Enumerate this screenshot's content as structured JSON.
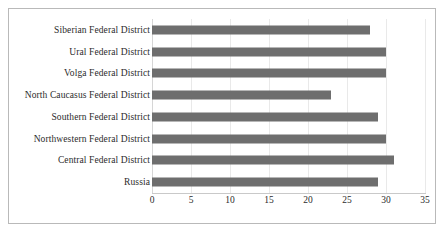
{
  "chart_data": {
    "type": "bar",
    "orientation": "horizontal",
    "title": "",
    "subtitle": "",
    "xlabel": "",
    "ylabel": "",
    "xlim": [
      0,
      35
    ],
    "xticks": [
      0,
      5,
      10,
      15,
      20,
      25,
      30,
      35
    ],
    "xtick_labels": [
      "0",
      "5",
      "10",
      "15",
      "20",
      "25",
      "30",
      "35"
    ],
    "grid": true,
    "legend": false,
    "legend_position": "none",
    "bar_color": "#6e6e6e",
    "gridline_color": "#e9e9e9",
    "frame_color": "#b9b9b9",
    "categories": [
      "Siberian Federal District",
      "Ural Federal District",
      "Volga Federal District",
      "North Caucasus Federal District",
      "Southern Federal District",
      "Northwestern Federal District",
      "Central Federal District",
      "Russia"
    ],
    "values": [
      28,
      30,
      30,
      23,
      29,
      30,
      31,
      29
    ],
    "bars": [
      {
        "label": "Siberian Federal District",
        "value": 28
      },
      {
        "label": "Ural Federal District",
        "value": 30
      },
      {
        "label": "Volga Federal District",
        "value": 30
      },
      {
        "label": "North Caucasus Federal District",
        "value": 23
      },
      {
        "label": "Southern Federal District",
        "value": 29
      },
      {
        "label": "Northwestern Federal District",
        "value": 30
      },
      {
        "label": "Central Federal District",
        "value": 31
      },
      {
        "label": "Russia",
        "value": 29
      }
    ]
  }
}
